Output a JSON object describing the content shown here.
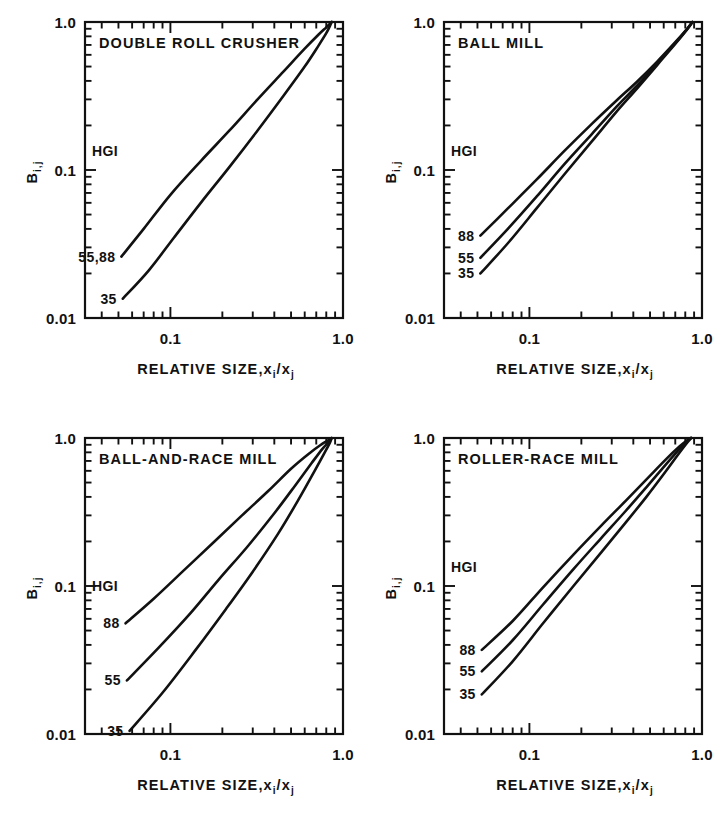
{
  "figure": {
    "background": "#ffffff",
    "ink": "#111111",
    "layout": "2x2 grid of log-log plots"
  },
  "axes_common": {
    "ylabel_main": "B",
    "ylabel_sub": "i,j",
    "xlabel_main": "RELATIVE SIZE,",
    "xlabel_x": "x",
    "xlabel_xsub_i": "i",
    "xlabel_slash": "/",
    "xlabel_xsub_j": "j",
    "y_ticklabels": [
      "1.0",
      "0.1",
      "0.01"
    ],
    "x_ticklabels": [
      "0.1",
      "1.0"
    ],
    "legend_header": "HGI",
    "xlim": [
      0.032,
      1.0
    ],
    "ylim": [
      0.01,
      1.0
    ],
    "xscale": "log",
    "yscale": "log",
    "grid": false
  },
  "chart_data": [
    {
      "type": "line",
      "title": "DOUBLE ROLL CRUSHER",
      "panel": "top-left",
      "xlabel": "RELATIVE SIZE, xi/xj",
      "ylabel": "Bi,j",
      "xscale": "log",
      "yscale": "log",
      "xlim": [
        0.032,
        1.0
      ],
      "ylim": [
        0.01,
        1.0
      ],
      "legend_header": "HGI",
      "legend_position": "inside-left",
      "series": [
        {
          "name": "55,88",
          "label": "55,88",
          "label_value": 0.026,
          "x": [
            0.052,
            0.07,
            0.1,
            0.15,
            0.22,
            0.32,
            0.45,
            0.6,
            0.72,
            0.8,
            0.84,
            0.86
          ],
          "y": [
            0.026,
            0.04,
            0.068,
            0.115,
            0.185,
            0.3,
            0.46,
            0.66,
            0.82,
            0.92,
            0.975,
            1.0
          ]
        },
        {
          "name": "35",
          "label": "35",
          "label_value": 0.0135,
          "x": [
            0.053,
            0.075,
            0.105,
            0.15,
            0.22,
            0.32,
            0.45,
            0.6,
            0.72,
            0.8,
            0.845,
            0.86
          ],
          "y": [
            0.0135,
            0.021,
            0.035,
            0.06,
            0.105,
            0.185,
            0.315,
            0.5,
            0.69,
            0.84,
            0.955,
            1.0
          ]
        }
      ]
    },
    {
      "type": "line",
      "title": "BALL MILL",
      "panel": "top-right",
      "xlabel": "RELATIVE SIZE, xi/xj",
      "ylabel": "Bi,j",
      "xscale": "log",
      "yscale": "log",
      "xlim": [
        0.032,
        1.0
      ],
      "ylim": [
        0.01,
        1.0
      ],
      "legend_header": "HGI",
      "legend_position": "inside-left",
      "series": [
        {
          "name": "88",
          "label": "88",
          "label_value": 0.036,
          "x": [
            0.052,
            0.075,
            0.11,
            0.16,
            0.23,
            0.32,
            0.42,
            0.55,
            0.7,
            0.82,
            0.88
          ],
          "y": [
            0.036,
            0.055,
            0.086,
            0.135,
            0.205,
            0.295,
            0.395,
            0.54,
            0.73,
            0.9,
            1.0
          ]
        },
        {
          "name": "55",
          "label": "55",
          "label_value": 0.0255,
          "x": [
            0.052,
            0.075,
            0.11,
            0.16,
            0.23,
            0.32,
            0.42,
            0.55,
            0.7,
            0.82,
            0.88
          ],
          "y": [
            0.0255,
            0.04,
            0.066,
            0.11,
            0.175,
            0.268,
            0.372,
            0.525,
            0.72,
            0.895,
            1.0
          ]
        },
        {
          "name": "35",
          "label": "35",
          "label_value": 0.02,
          "x": [
            0.052,
            0.075,
            0.11,
            0.16,
            0.23,
            0.32,
            0.42,
            0.55,
            0.7,
            0.82,
            0.88
          ],
          "y": [
            0.02,
            0.032,
            0.055,
            0.094,
            0.156,
            0.248,
            0.355,
            0.512,
            0.712,
            0.892,
            1.0
          ]
        }
      ]
    },
    {
      "type": "line",
      "title": "BALL-AND-RACE MILL",
      "panel": "bottom-left",
      "xlabel": "RELATIVE SIZE, xi/xj",
      "ylabel": "Bi,j",
      "xscale": "log",
      "yscale": "log",
      "xlim": [
        0.032,
        1.0
      ],
      "ylim": [
        0.01,
        1.0
      ],
      "legend_header": "HGI",
      "legend_position": "inside-left",
      "series": [
        {
          "name": "88",
          "label": "88",
          "label_value": 0.056,
          "x": [
            0.055,
            0.08,
            0.12,
            0.18,
            0.26,
            0.37,
            0.5,
            0.64,
            0.75,
            0.82,
            0.86
          ],
          "y": [
            0.056,
            0.082,
            0.128,
            0.2,
            0.3,
            0.44,
            0.62,
            0.79,
            0.905,
            0.965,
            1.0
          ]
        },
        {
          "name": "55",
          "label": "55",
          "label_value": 0.023,
          "x": [
            0.056,
            0.085,
            0.13,
            0.19,
            0.28,
            0.4,
            0.53,
            0.66,
            0.76,
            0.83,
            0.86
          ],
          "y": [
            0.023,
            0.038,
            0.065,
            0.11,
            0.185,
            0.31,
            0.48,
            0.68,
            0.845,
            0.945,
            1.0
          ]
        },
        {
          "name": "35",
          "label": "35",
          "label_value": 0.0105,
          "x": [
            0.058,
            0.09,
            0.14,
            0.21,
            0.3,
            0.42,
            0.55,
            0.68,
            0.78,
            0.84,
            0.86
          ],
          "y": [
            0.0105,
            0.019,
            0.037,
            0.07,
            0.125,
            0.225,
            0.38,
            0.59,
            0.79,
            0.93,
            1.0
          ]
        }
      ]
    },
    {
      "type": "line",
      "title": "ROLLER-RACE MILL",
      "panel": "bottom-right",
      "xlabel": "RELATIVE SIZE, xi/xj",
      "ylabel": "Bi,j",
      "xscale": "log",
      "yscale": "log",
      "xlim": [
        0.032,
        1.0
      ],
      "ylim": [
        0.01,
        1.0
      ],
      "legend_header": "HGI",
      "legend_position": "inside-left",
      "series": [
        {
          "name": "88",
          "label": "88",
          "label_value": 0.037,
          "x": [
            0.053,
            0.08,
            0.12,
            0.18,
            0.26,
            0.36,
            0.48,
            0.62,
            0.74,
            0.82,
            0.865
          ],
          "y": [
            0.037,
            0.058,
            0.098,
            0.163,
            0.255,
            0.375,
            0.53,
            0.72,
            0.875,
            0.965,
            1.0
          ]
        },
        {
          "name": "55",
          "label": "55",
          "label_value": 0.0265,
          "x": [
            0.053,
            0.08,
            0.12,
            0.18,
            0.26,
            0.36,
            0.48,
            0.62,
            0.74,
            0.82,
            0.865
          ],
          "y": [
            0.0265,
            0.043,
            0.075,
            0.13,
            0.21,
            0.32,
            0.47,
            0.665,
            0.84,
            0.95,
            1.0
          ]
        },
        {
          "name": "35",
          "label": "35",
          "label_value": 0.0185,
          "x": [
            0.053,
            0.08,
            0.12,
            0.18,
            0.26,
            0.36,
            0.48,
            0.62,
            0.74,
            0.82,
            0.865
          ],
          "y": [
            0.0185,
            0.031,
            0.056,
            0.1,
            0.168,
            0.267,
            0.405,
            0.6,
            0.795,
            0.93,
            1.0
          ]
        }
      ]
    }
  ]
}
